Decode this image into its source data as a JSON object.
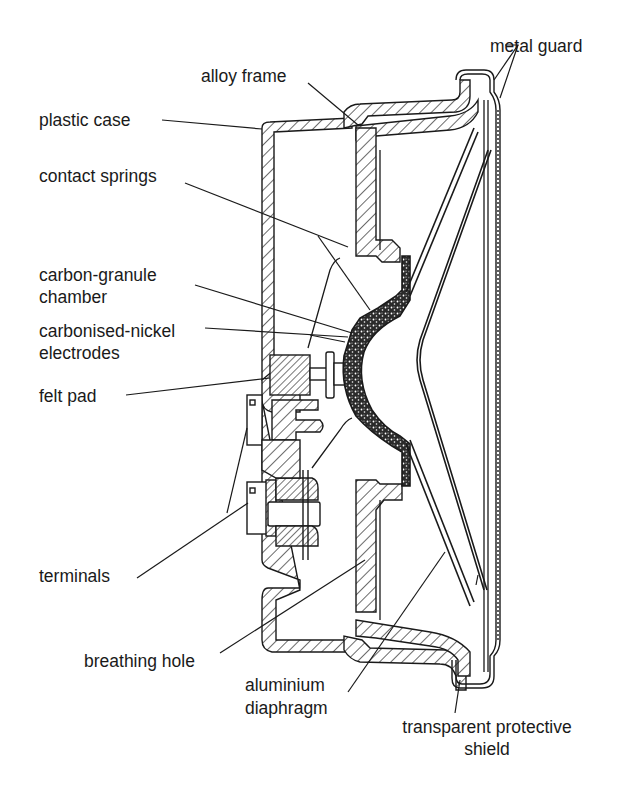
{
  "diagram": {
    "labels": {
      "metal_guard": "metal guard",
      "alloy_frame": "alloy frame",
      "plastic_case": "plastic case",
      "contact_springs": "contact springs",
      "carbon_granule_chamber_1": "carbon-granule",
      "carbon_granule_chamber_2": "chamber",
      "carbonised_nickel_1": "carbonised-nickel",
      "carbonised_nickel_2": "electrodes",
      "felt_pad": "felt pad",
      "terminals": "terminals",
      "breathing_hole": "breathing hole",
      "aluminium_diaphragm_1": "aluminium",
      "aluminium_diaphragm_2": "diaphragm",
      "transparent_shield_1": "transparent protective",
      "transparent_shield_2": "shield"
    },
    "colors": {
      "ink": "#1a1a1a",
      "background": "#ffffff",
      "granules": "#2a2a2a"
    }
  }
}
